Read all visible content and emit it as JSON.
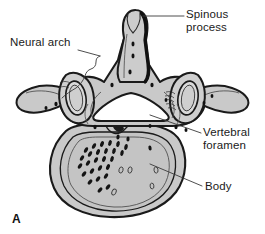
{
  "figure": {
    "panel_letter": "A",
    "background_color": "#ffffff",
    "ink_color": "#1a1a1a"
  },
  "labels": {
    "spinous_process": "Spinous\nprocess",
    "neural_arch": "Neural arch",
    "vertebral_foramen": "Vertebral\nforamen",
    "body": "Body"
  },
  "colors": {
    "bone_fill": "#c9c9c9",
    "bone_fill_light": "#d6d6d6",
    "bone_fill_dark": "#b4b4b4",
    "foramen_fill": "#ffffff",
    "outline": "#1a1a1a",
    "stipple": "#141414",
    "leader_line": "#3a3a3a"
  }
}
